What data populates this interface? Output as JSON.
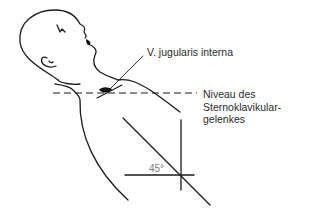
{
  "figure": {
    "type": "anatomical-diagram",
    "colors": {
      "line": "#1a1a1a",
      "text": "#2a2a2a",
      "angle_text": "#7a7a7a",
      "background": "#ffffff"
    }
  },
  "labels": {
    "jugular": "V. jugularis interna",
    "level_line1": "Niveau des",
    "level_line2": "Sternoklavikular-",
    "level_line3": "gelenkes",
    "angle": "45°"
  }
}
